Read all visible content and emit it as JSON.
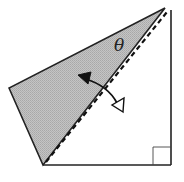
{
  "diagram": {
    "angle_label": "θ",
    "colors": {
      "background": "#ffffff",
      "stroke": "#222222",
      "shaded_flap": "#b8b8b8",
      "arrow_filled": "#111111",
      "arrow_open": "#ffffff"
    },
    "elements": [
      {
        "name": "right-triangle",
        "type": "outline",
        "vertices": [
          [
            43,
            165
          ],
          [
            171,
            165
          ],
          [
            171,
            10
          ]
        ]
      },
      {
        "name": "folded-flap",
        "type": "shaded-triangle",
        "vertices": [
          [
            9,
            88
          ],
          [
            43,
            165
          ],
          [
            165,
            8
          ]
        ]
      },
      {
        "name": "fold-line",
        "type": "dashed-line",
        "from": [
          45,
          163
        ],
        "to": [
          167,
          12
        ]
      },
      {
        "name": "right-angle-marker",
        "type": "square",
        "x": 153,
        "y": 147,
        "size": 18
      },
      {
        "name": "rotation-arrow",
        "type": "curved-double-arrow",
        "from": [
          80,
          76
        ],
        "to": [
          121,
          110
        ],
        "heads": [
          "filled",
          "open"
        ]
      }
    ]
  }
}
